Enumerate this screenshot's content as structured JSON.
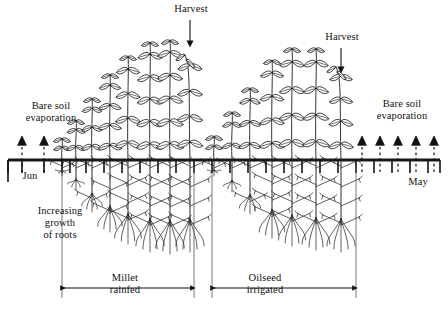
{
  "figure": {
    "type": "agronomy-cropping-cycle-diagram"
  },
  "labels": {
    "bare_soil_left": "Bare soil\nevaporation",
    "bare_soil_right": "Bare soil\nevaporation",
    "harvest_1": "Harvest",
    "harvest_2": "Harvest",
    "month_start": "Jun",
    "month_end": "May",
    "roots_note": "Increasing\ngrowth\nof roots",
    "span_1": "Millet\nrainfed",
    "span_2": "Oilseed\nirrigated"
  },
  "colors": {
    "ink": "#111111",
    "soil_line": "#1a1a1a",
    "stem": "#333333",
    "root": "#2b2b2b",
    "background": "#ffffff"
  },
  "geometry": {
    "soil_line_y": 160,
    "soil_line_x1": 8,
    "soil_line_x2": 440,
    "soil_line_width": 3,
    "canvas": {
      "width": 448,
      "height": 311
    }
  },
  "evaporation_arrows": {
    "left_count": 2,
    "right_count": 5,
    "left_x": [
      22,
      44
    ],
    "right_x": [
      362,
      380,
      398,
      416,
      434
    ],
    "style": "dashed-stem-solid-triangle-head-pointing-up"
  },
  "harvest_arrows": {
    "count": 2,
    "x": [
      190,
      341
    ],
    "style": "solid-line-down-arrow"
  },
  "soil_ticks": {
    "comment": "short vertical ticks hanging below the soil line marking time steps",
    "x": [
      8,
      22,
      44,
      62,
      70,
      86,
      104,
      122,
      140,
      158,
      176,
      194,
      212,
      230,
      248,
      266,
      284,
      302,
      320,
      338,
      356,
      374,
      392,
      410,
      428,
      440
    ]
  },
  "crops": [
    {
      "name": "Millet rainfed",
      "span_x": [
        62,
        194
      ],
      "plants": [
        {
          "x": 62,
          "shoot_height": 22,
          "leaf_tiers": 1,
          "root_depth": 16,
          "root_stage": "seedling"
        },
        {
          "x": 76,
          "shoot_height": 40,
          "leaf_tiers": 2,
          "root_depth": 30,
          "root_stage": "young"
        },
        {
          "x": 92,
          "shoot_height": 62,
          "leaf_tiers": 3,
          "root_depth": 52,
          "root_stage": "developing"
        },
        {
          "x": 110,
          "shoot_height": 86,
          "leaf_tiers": 4,
          "root_depth": 72,
          "root_stage": "developing"
        },
        {
          "x": 128,
          "shoot_height": 104,
          "leaf_tiers": 4,
          "root_depth": 84,
          "root_stage": "mature"
        },
        {
          "x": 150,
          "shoot_height": 118,
          "leaf_tiers": 5,
          "root_depth": 92,
          "root_stage": "mature"
        },
        {
          "x": 170,
          "shoot_height": 120,
          "leaf_tiers": 5,
          "root_depth": 94,
          "root_stage": "mature"
        },
        {
          "x": 190,
          "shoot_height": 108,
          "leaf_tiers": 4,
          "root_depth": 92,
          "root_stage": "harvest"
        }
      ]
    },
    {
      "name": "Oilseed irrigated",
      "span_x": [
        212,
        356
      ],
      "plants": [
        {
          "x": 214,
          "shoot_height": 24,
          "leaf_tiers": 1,
          "root_depth": 16,
          "root_stage": "seedling"
        },
        {
          "x": 232,
          "shoot_height": 48,
          "leaf_tiers": 2,
          "root_depth": 32,
          "root_stage": "young"
        },
        {
          "x": 250,
          "shoot_height": 72,
          "leaf_tiers": 3,
          "root_depth": 54,
          "root_stage": "developing"
        },
        {
          "x": 272,
          "shoot_height": 100,
          "leaf_tiers": 4,
          "root_depth": 78,
          "root_stage": "developing"
        },
        {
          "x": 292,
          "shoot_height": 112,
          "leaf_tiers": 4,
          "root_depth": 86,
          "root_stage": "mature"
        },
        {
          "x": 316,
          "shoot_height": 112,
          "leaf_tiers": 4,
          "root_depth": 90,
          "root_stage": "mature"
        },
        {
          "x": 341,
          "shoot_height": 96,
          "leaf_tiers": 4,
          "root_depth": 92,
          "root_stage": "harvest"
        }
      ]
    }
  ],
  "span_arrows": [
    {
      "label_key": "span_1",
      "x1": 62,
      "x2": 194,
      "y": 288
    },
    {
      "label_key": "span_2",
      "x1": 212,
      "x2": 356,
      "y": 288
    }
  ]
}
